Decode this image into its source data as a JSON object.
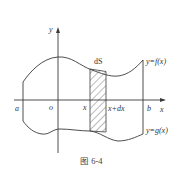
{
  "figure": {
    "caption": "图 6-4",
    "labels": {
      "y_axis": "y",
      "x_axis": "x",
      "origin": "o",
      "a": "a",
      "b": "b",
      "x": "x",
      "x_plus_dx": "x+dx",
      "dS": "dS",
      "upper_curve": "y=f(x)",
      "lower_curve": "y=g(x)"
    }
  }
}
